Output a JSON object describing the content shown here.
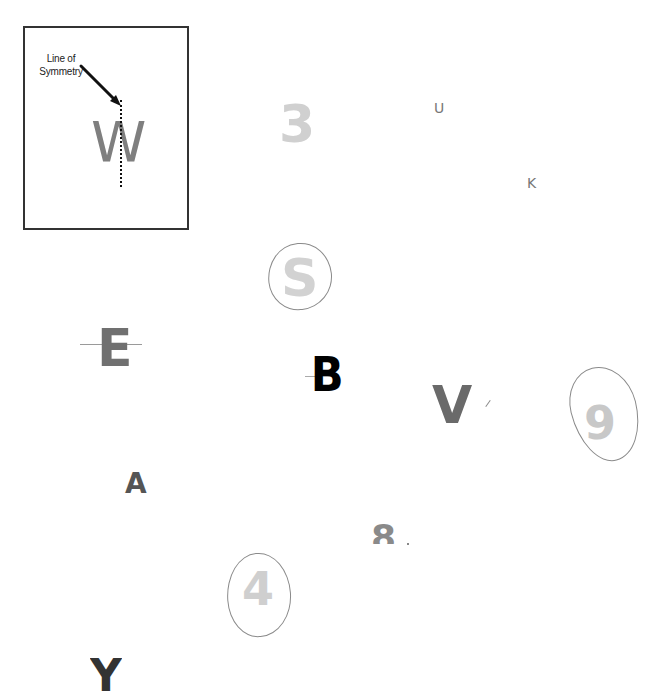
{
  "example": {
    "label": "Line of Symmetry",
    "label_line1": "Line of",
    "label_line2": "Symmetry",
    "letter": "W"
  },
  "glyphs": {
    "three": "3",
    "u": "U",
    "k": "K",
    "s": "S",
    "e": "E",
    "b": "B",
    "v": "V",
    "nine": "9",
    "a": "A",
    "eight": "8",
    "four": "4",
    "y": "Y"
  },
  "circled": [
    "S",
    "9",
    "4"
  ],
  "colors": {
    "border": "#333333",
    "light_glyph": "#d0d0d0",
    "dark_glyph": "#6a6a6a",
    "circle": "#8a8a8a"
  }
}
